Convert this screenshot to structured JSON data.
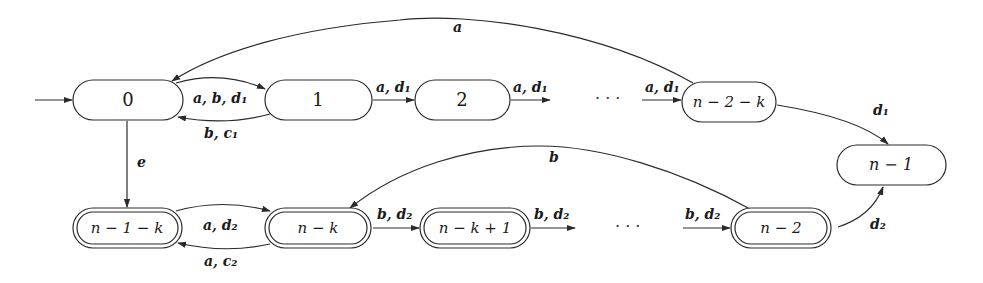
{
  "diagram": {
    "type": "state-automaton",
    "nodes": {
      "s0": {
        "label": "0",
        "accepting": false,
        "initial": true
      },
      "s1": {
        "label": "1",
        "accepting": false
      },
      "s2": {
        "label": "2",
        "accepting": false
      },
      "sn2k": {
        "label": "n − 2 − k",
        "accepting": false
      },
      "sn1": {
        "label": "n − 1",
        "accepting": false
      },
      "sn1k": {
        "label": "n − 1 − k",
        "accepting": true
      },
      "snk": {
        "label": "n − k",
        "accepting": true
      },
      "snk1": {
        "label": "n − k + 1",
        "accepting": true
      },
      "sn2": {
        "label": "n − 2",
        "accepting": true
      }
    },
    "edges": {
      "e_0_1": {
        "from": "0",
        "to": "1",
        "label": "a, b, d₁"
      },
      "e_1_0": {
        "from": "1",
        "to": "0",
        "label": "b, c₁"
      },
      "e_1_2": {
        "from": "1",
        "to": "2",
        "label": "a, d₁"
      },
      "e_2_out": {
        "from": "2",
        "to": "…",
        "label": "a, d₁"
      },
      "e_in_n2k": {
        "from": "…",
        "to": "n − 2 − k",
        "label": "a, d₁"
      },
      "e_n2k_0": {
        "from": "n − 2 − k",
        "to": "0",
        "label": "a"
      },
      "e_n2k_n1": {
        "from": "n − 2 − k",
        "to": "n − 1",
        "label": "d₁"
      },
      "e_0_n1k": {
        "from": "0",
        "to": "n − 1 − k",
        "label": "e"
      },
      "e_n1k_nk": {
        "from": "n − 1 − k",
        "to": "n − k",
        "label": "a, d₂"
      },
      "e_nk_n1k": {
        "from": "n − k",
        "to": "n − 1 − k",
        "label": "a, c₂"
      },
      "e_nk_nk1": {
        "from": "n − k",
        "to": "n − k + 1",
        "label": "b, d₂"
      },
      "e_nk1_out": {
        "from": "n − k + 1",
        "to": "…",
        "label": "b, d₂"
      },
      "e_in_n2": {
        "from": "…",
        "to": "n − 2",
        "label": "b, d₂"
      },
      "e_n2_nk": {
        "from": "n − 2",
        "to": "n − k",
        "label": "b"
      },
      "e_n2_n1": {
        "from": "n − 2",
        "to": "n − 1",
        "label": "d₂"
      }
    },
    "ellipsis": {
      "top": "· · ·",
      "bottom": "· · ·"
    }
  }
}
